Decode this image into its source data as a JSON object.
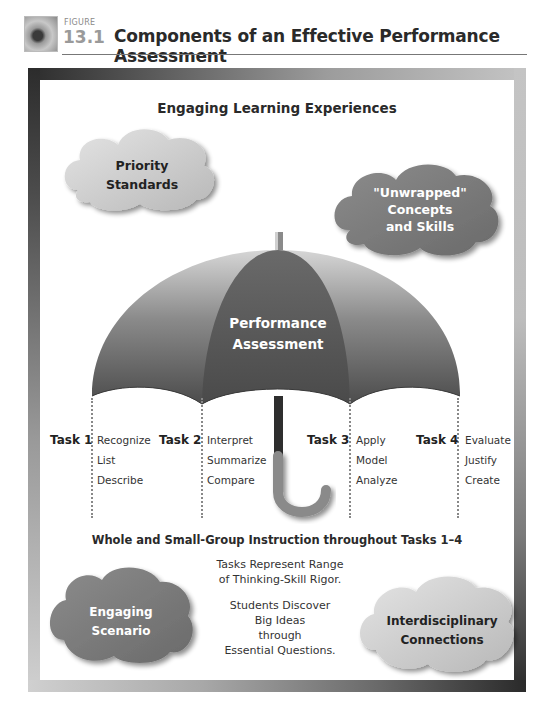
{
  "header": {
    "figure_word": "FIGURE",
    "figure_number": "13.1",
    "title": "Components of an Effective Performance Assessment"
  },
  "diagram": {
    "top_heading": "Engaging Learning Experiences",
    "clouds": {
      "priority_standards": {
        "line1": "Priority",
        "line2": "Standards"
      },
      "unwrapped": {
        "line1": "\"Unwrapped\"",
        "line2": "Concepts",
        "line3": "and Skills"
      },
      "engaging_scenario": {
        "line1": "Engaging",
        "line2": "Scenario"
      },
      "interdisciplinary": {
        "line1": "Interdisciplinary",
        "line2": "Connections"
      }
    },
    "umbrella": {
      "line1": "Performance",
      "line2": "Assessment"
    },
    "tasks": [
      {
        "label": "Task 1",
        "skills": [
          "Recognize",
          "List",
          "Describe"
        ]
      },
      {
        "label": "Task 2",
        "skills": [
          "Interpret",
          "Summarize",
          "Compare"
        ]
      },
      {
        "label": "Task 3",
        "skills": [
          "Apply",
          "Model",
          "Analyze"
        ]
      },
      {
        "label": "Task 4",
        "skills": [
          "Evaluate",
          "Justify",
          "Create"
        ]
      }
    ],
    "instruction_heading": "Whole and Small-Group Instruction throughout Tasks 1–4",
    "notes": {
      "rigor_line1": "Tasks Represent Range",
      "rigor_line2": "of Thinking-Skill Rigor.",
      "discover_line1": "Students Discover",
      "discover_line2": "Big Ideas",
      "discover_line3": "through",
      "discover_line4": "Essential Questions."
    }
  },
  "colors": {
    "canopy_dark": "#4a4a4a",
    "canopy_light": "#9a9a9a",
    "cloud_light": "#cfcfcf",
    "cloud_dark": "#7a7a7a"
  }
}
